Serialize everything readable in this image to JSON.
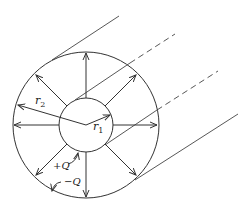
{
  "diagram": {
    "colors": {
      "stroke": "#333333",
      "background": "#ffffff"
    },
    "labels": {
      "outer_radius": "r",
      "outer_radius_sub": "2",
      "inner_radius": "r",
      "inner_radius_sub": "1",
      "inner_charge": "+Q",
      "outer_charge": "−Q"
    },
    "geometry": {
      "center": [
        86,
        125
      ],
      "outer_radius_px": 73,
      "inner_radius_px": 27,
      "field_arrow_count": 8
    }
  }
}
